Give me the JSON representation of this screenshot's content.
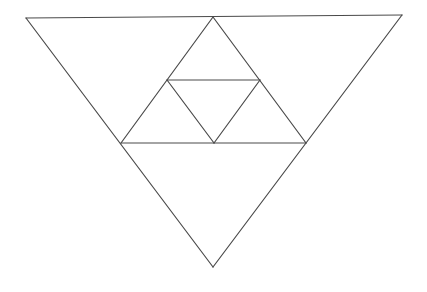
{
  "diagram": {
    "line_color": "#4a4a4a",
    "background": "#ffffff",
    "points": {
      "A_top_left": [
        26,
        18
      ],
      "B_top_right": [
        402,
        15
      ],
      "C_bottom": [
        213,
        267
      ],
      "M_top_mid": [
        213,
        17
      ],
      "L_left_mid": [
        121,
        143
      ],
      "R_right_mid": [
        306,
        143
      ],
      "P_inner_left": [
        167,
        80
      ],
      "Q_inner_right": [
        260,
        80
      ],
      "S_inner_bottom": [
        214,
        143
      ]
    },
    "segments": [
      {
        "name": "outer-top-edge",
        "from": "A_top_left",
        "to": "B_top_right"
      },
      {
        "name": "outer-left-edge",
        "from": "A_top_left",
        "to": "C_bottom"
      },
      {
        "name": "outer-right-edge",
        "from": "B_top_right",
        "to": "C_bottom"
      },
      {
        "name": "middle-left-edge",
        "from": "M_top_mid",
        "to": "L_left_mid"
      },
      {
        "name": "middle-right-edge",
        "from": "M_top_mid",
        "to": "R_right_mid"
      },
      {
        "name": "middle-base",
        "from": "L_left_mid",
        "to": "R_right_mid"
      },
      {
        "name": "inner-top-edge",
        "from": "P_inner_left",
        "to": "Q_inner_right"
      },
      {
        "name": "inner-left-edge",
        "from": "P_inner_left",
        "to": "S_inner_bottom"
      },
      {
        "name": "inner-right-edge",
        "from": "Q_inner_right",
        "to": "S_inner_bottom"
      }
    ]
  }
}
